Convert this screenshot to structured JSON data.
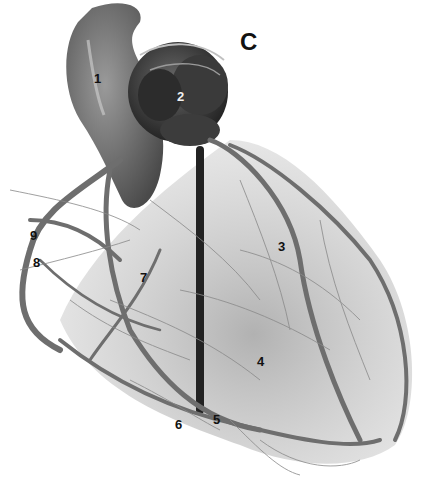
{
  "figure": {
    "panel_letter": "C",
    "labels": [
      {
        "id": "1",
        "text": "1",
        "x": 94,
        "y": 72,
        "tone": "dark"
      },
      {
        "id": "2",
        "text": "2",
        "x": 177,
        "y": 90,
        "tone": "light"
      },
      {
        "id": "3",
        "text": "3",
        "x": 278,
        "y": 240,
        "tone": "dark"
      },
      {
        "id": "4",
        "text": "4",
        "x": 257,
        "y": 355,
        "tone": "dark"
      },
      {
        "id": "5",
        "text": "5",
        "x": 213,
        "y": 413,
        "tone": "dark"
      },
      {
        "id": "6",
        "text": "6",
        "x": 175,
        "y": 418,
        "tone": "dark"
      },
      {
        "id": "7",
        "text": "7",
        "x": 140,
        "y": 271,
        "tone": "dark"
      },
      {
        "id": "8",
        "text": "8",
        "x": 33,
        "y": 256,
        "tone": "dark"
      },
      {
        "id": "9",
        "text": "9",
        "x": 30,
        "y": 229,
        "tone": "dark"
      }
    ]
  }
}
